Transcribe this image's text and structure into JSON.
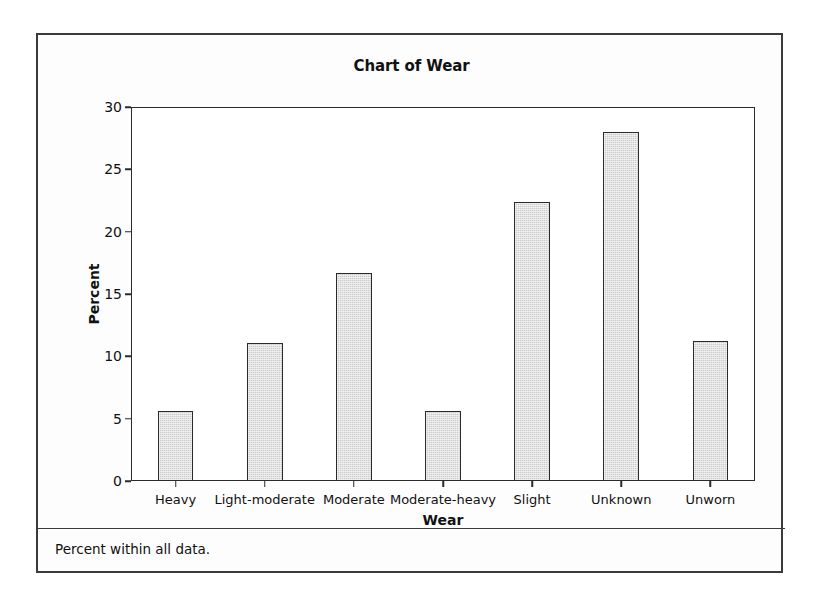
{
  "figure": {
    "title": "Chart of Wear",
    "footnote": "Percent within all data.",
    "frame_color": "#3a3a3a",
    "bar_fill_color": "#cccccc",
    "bar_edge_color": "#2b2b2b"
  },
  "chart_data": {
    "type": "bar",
    "title": "Chart of Wear",
    "xlabel": "Wear",
    "ylabel": "Percent",
    "categories": [
      "Heavy",
      "Light-moderate",
      "Moderate",
      "Moderate-heavy",
      "Slight",
      "Unknown",
      "Unworn"
    ],
    "values": [
      5.6,
      11.1,
      16.7,
      5.6,
      22.4,
      28.0,
      11.2
    ],
    "ylim": [
      0,
      30
    ],
    "yticks": [
      0,
      5,
      10,
      15,
      20,
      25,
      30
    ],
    "ytick_labels": [
      "0",
      "5",
      "10",
      "15",
      "20",
      "25",
      "30"
    ],
    "grid": false,
    "legend": null,
    "annotations": [
      "Percent within all data."
    ]
  }
}
